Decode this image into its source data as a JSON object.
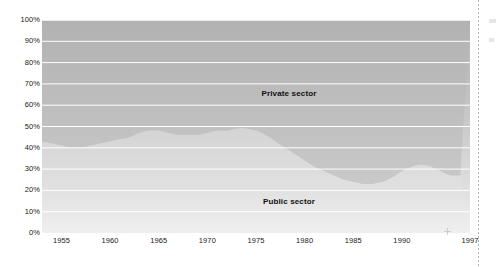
{
  "chart_data": {
    "type": "area",
    "title": "",
    "subtitle": "",
    "xlabel": "",
    "ylabel": "",
    "stacked": true,
    "stack_total_percent": 100,
    "grid": true,
    "gridline_color": "#ffffff",
    "legend_position": "inside-plot",
    "xlim": [
      1953,
      1997
    ],
    "ylim": [
      0,
      100
    ],
    "y_tick_labels": [
      "100%",
      "90%",
      "80%",
      "70%",
      "60%",
      "50%",
      "40%",
      "30%",
      "20%",
      "10%",
      "0%"
    ],
    "y_tick_values": [
      100,
      90,
      80,
      70,
      60,
      50,
      40,
      30,
      20,
      10,
      0
    ],
    "x_tick_labels": [
      "1955",
      "1960",
      "1965",
      "1970",
      "1975",
      "1980",
      "1985",
      "1990",
      "1997"
    ],
    "x_tick_values": [
      1955,
      1960,
      1965,
      1970,
      1975,
      1980,
      1985,
      1990,
      1997
    ],
    "series": [
      {
        "name": "Private sector",
        "color": "#b9b9b9",
        "label_x_year": 1974,
        "label_y_percent": 76,
        "stack_order": "top",
        "values": [
          57,
          58,
          59,
          60,
          60,
          59,
          58,
          57,
          56,
          55,
          53,
          52,
          52,
          53,
          54,
          54,
          54,
          53,
          52,
          52,
          51,
          51,
          52,
          54,
          57,
          60,
          63,
          66,
          69,
          71,
          73,
          75,
          76,
          77,
          77,
          76,
          74,
          71,
          69,
          68,
          69,
          71,
          73,
          73
        ]
      },
      {
        "name": "Public sector",
        "color": "#dcdcdc",
        "label_x_year": 1974,
        "label_y_percent": 26,
        "stack_order": "bottom",
        "values": [
          43,
          42,
          41,
          40,
          40,
          41,
          42,
          43,
          44,
          45,
          47,
          48,
          48,
          47,
          46,
          46,
          46,
          47,
          48,
          48,
          49,
          49,
          48,
          46,
          43,
          40,
          37,
          34,
          31,
          29,
          27,
          25,
          24,
          23,
          23,
          24,
          26,
          29,
          31,
          32,
          31,
          29,
          27,
          27
        ]
      }
    ],
    "x": [
      1953,
      1954,
      1955,
      1956,
      1957,
      1958,
      1959,
      1960,
      1961,
      1962,
      1963,
      1964,
      1965,
      1966,
      1967,
      1968,
      1969,
      1970,
      1971,
      1972,
      1973,
      1974,
      1975,
      1976,
      1977,
      1978,
      1979,
      1980,
      1981,
      1982,
      1983,
      1984,
      1985,
      1986,
      1987,
      1988,
      1989,
      1990,
      1991,
      1992,
      1993,
      1994,
      1995,
      1996
    ]
  },
  "labels": {
    "private_sector": "Private sector",
    "public_sector": "Public sector"
  },
  "y_axis": {
    "ticks": [
      {
        "label": "100%",
        "value": 100
      },
      {
        "label": "90%",
        "value": 90
      },
      {
        "label": "80%",
        "value": 80
      },
      {
        "label": "70%",
        "value": 70
      },
      {
        "label": "60%",
        "value": 60
      },
      {
        "label": "50%",
        "value": 50
      },
      {
        "label": "40%",
        "value": 40
      },
      {
        "label": "30%",
        "value": 30
      },
      {
        "label": "20%",
        "value": 20
      },
      {
        "label": "10%",
        "value": 10
      },
      {
        "label": "0%",
        "value": 0
      }
    ]
  },
  "x_axis": {
    "ticks": [
      {
        "label": "1955",
        "value": 1955
      },
      {
        "label": "1960",
        "value": 1960
      },
      {
        "label": "1965",
        "value": 1965
      },
      {
        "label": "1970",
        "value": 1970
      },
      {
        "label": "1975",
        "value": 1975
      },
      {
        "label": "1980",
        "value": 1980
      },
      {
        "label": "1985",
        "value": 1985
      },
      {
        "label": "1990",
        "value": 1990
      },
      {
        "label": "1997",
        "value": 1997
      }
    ]
  },
  "colors": {
    "private_fill": "#b9b9b9",
    "public_fill": "#dcdcdc",
    "gridline": "#ffffff",
    "text": "#1a1a1a"
  }
}
